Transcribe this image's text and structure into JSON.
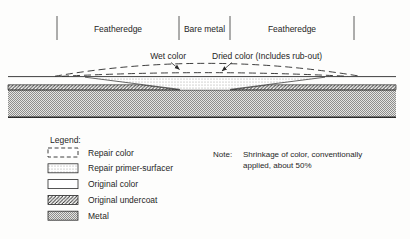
{
  "diagram": {
    "title_implicit": "Paint repair featheredge cross-section",
    "ruler": {
      "labels": [
        {
          "label": "Featheredge"
        },
        {
          "label": "Bare metal"
        },
        {
          "label": "Featheredge"
        }
      ]
    },
    "callouts": {
      "wet_color": "Wet color",
      "dried_color": "Dried color (Includes rub-out)"
    },
    "legend": {
      "title": "Legend:",
      "items": [
        {
          "label": "Repair color",
          "swatch": "dashed-outline-box"
        },
        {
          "label": "Repair primer-surfacer",
          "swatch": "fine-stipple-box"
        },
        {
          "label": "Original color",
          "swatch": "plain-white-box"
        },
        {
          "label": "Original undercoat",
          "swatch": "diagonal-hatch-box"
        },
        {
          "label": "Metal",
          "swatch": "gray-stipple-box"
        }
      ]
    },
    "note": {
      "label": "Note:",
      "line1": "Shrinkage of color, conventionally",
      "line2": "applied, about 50%"
    },
    "colors": {
      "ink": "#2a2a2a",
      "metal_fill": "#b5b5b3",
      "background": "#fdfdfc"
    }
  }
}
